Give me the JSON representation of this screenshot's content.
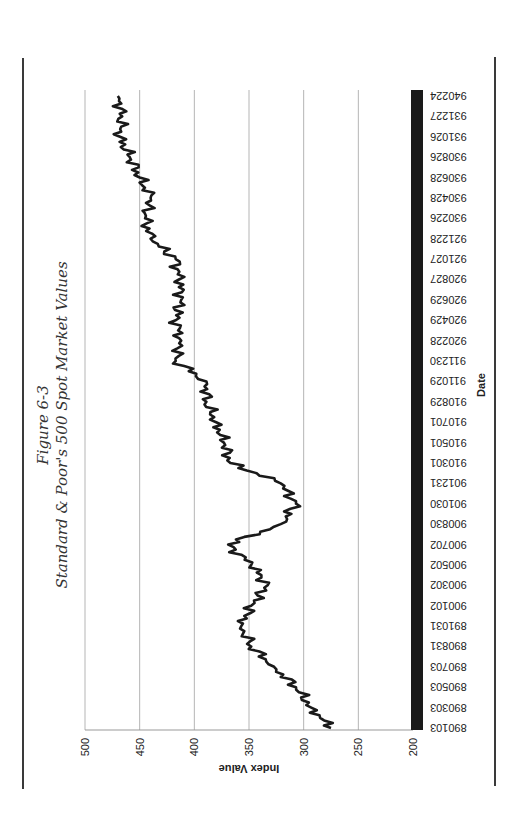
{
  "figure": {
    "number": "Figure 6-3",
    "title": "Standard & Poor's 500 Spot Market Values"
  },
  "chart_data": {
    "type": "line",
    "title": "Standard & Poor's 500 Spot Market Values",
    "subtitle": "Figure 6-3",
    "xlabel": "Date",
    "ylabel": "Index Value",
    "ylim": [
      200,
      500
    ],
    "yticks": [
      200,
      250,
      300,
      350,
      400,
      450,
      500
    ],
    "grid": "horizontal major gridlines",
    "legend": "none",
    "orientation_note": "page rotated 90 degrees counter-clockwise",
    "categories": [
      "890103",
      "890303",
      "890503",
      "890703",
      "890831",
      "891031",
      "900102",
      "900302",
      "900502",
      "900702",
      "900830",
      "901030",
      "901231",
      "910301",
      "910501",
      "910701",
      "910829",
      "911029",
      "911230",
      "920228",
      "920429",
      "920629",
      "920827",
      "921027",
      "921228",
      "930226",
      "930428",
      "930628",
      "930826",
      "931026",
      "931227",
      "940224"
    ],
    "series": [
      {
        "name": "S&P 500",
        "color": "#1a1a1a",
        "values": [
          275,
          293,
          307,
          327,
          348,
          357,
          348,
          333,
          348,
          369,
          321,
          307,
          321,
          367,
          373,
          380,
          389,
          389,
          417,
          412,
          417,
          412,
          414,
          417,
          440,
          445,
          440,
          450,
          459,
          468,
          466,
          470
        ]
      }
    ],
    "colors": {
      "line": "#1a1a1a",
      "grid": "#b5b5b5",
      "axis_band": "#1a1a1a"
    }
  }
}
